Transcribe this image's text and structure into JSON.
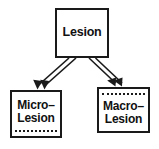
{
  "diagram": {
    "type": "node-arrow-diagram",
    "colors": {
      "stroke": "#1a1a1a",
      "fill": "#ffffff",
      "text": "#111111"
    },
    "nodes": [
      {
        "id": "lesion",
        "label": "Lesion",
        "role": "parent",
        "decoration": "none"
      },
      {
        "id": "micro-lesion",
        "label": "Micro–\nLesion",
        "role": "child",
        "decoration": "dotted-line-bottom"
      },
      {
        "id": "macro-lesion",
        "label": "Macro–\nLesion",
        "role": "child",
        "decoration": "dotted-line-top"
      }
    ],
    "edges": [
      {
        "id": "edge-lesion-to-micro",
        "from": "Lesion",
        "to": "Micro–Lesion",
        "style": "double-line-arrow",
        "direction": "down-left"
      },
      {
        "id": "edge-lesion-to-macro",
        "from": "Lesion",
        "to": "Macro–Lesion",
        "style": "double-line-arrow",
        "direction": "down-right"
      }
    ]
  }
}
